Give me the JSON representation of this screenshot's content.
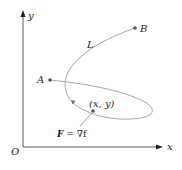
{
  "diagram": {
    "axes": {
      "x_label": "x",
      "y_label": "y",
      "origin_label": "O"
    },
    "points": {
      "A": {
        "label": "A"
      },
      "B": {
        "label": "B"
      },
      "P": {
        "label": "(x, y)"
      }
    },
    "curve_label": "L",
    "field_label_bold": "F",
    "field_label_rest": " = ∇f",
    "colors": {
      "axis": "#333333",
      "curve": "#a8a8a8",
      "point": "#555555",
      "text": "#222222"
    }
  }
}
